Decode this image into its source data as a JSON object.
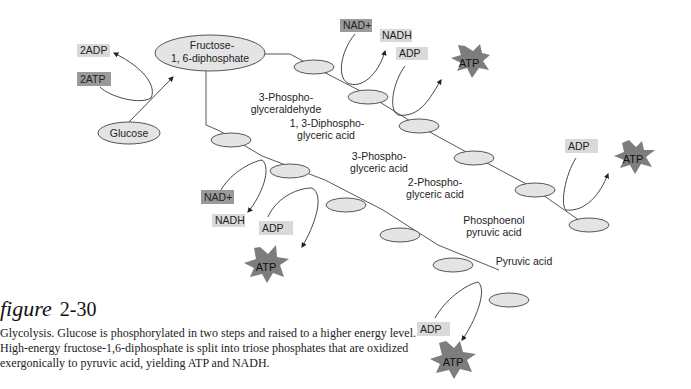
{
  "figure": {
    "label_word": "figure",
    "number": "2-30",
    "caption": "Glycolysis. Glucose is phosphorylated in two steps and raised to a higher energy level. High-energy fructose-1,6-diphosphate is split into triose phosphates that are oxidized exergonically to pyruvic acid, yielding ATP and NADH."
  },
  "diagram": {
    "glucose": "Glucose",
    "fructose_line1": "Fructose-",
    "fructose_line2": "1, 6-diphosphate",
    "input_2adp": "2ADP",
    "input_2atp": "2ATP",
    "intermediates": {
      "g3p_line1": "3-Phospho-",
      "g3p_line2": "glyceraldehyde",
      "bpg_line1": "1, 3-Diphospho-",
      "bpg_line2": "glyceric acid",
      "pg3_line1": "3-Phospho-",
      "pg3_line2": "glyceric acid",
      "pg2_line1": "2-Phospho-",
      "pg2_line2": "glyceric acid",
      "pep_line1": "Phosphoenol",
      "pep_line2": "pyruvic acid",
      "pyruvate": "Pyruvic acid"
    },
    "upper_branch": {
      "nad": "NAD+",
      "nadh": "NADH",
      "adp1": "ADP",
      "atp1": "ATP",
      "adp2": "ADP",
      "atp2": "ATP"
    },
    "lower_branch": {
      "nad": "NAD+",
      "nadh": "NADH",
      "adp1": "ADP",
      "atp1": "ATP",
      "adp2": "ADP",
      "atp2": "ATP"
    }
  }
}
